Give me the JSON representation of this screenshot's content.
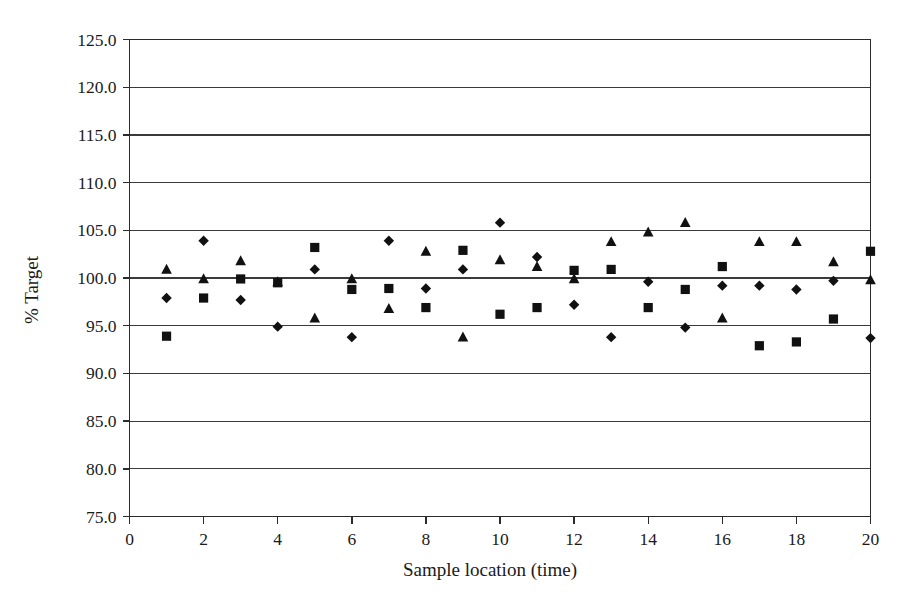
{
  "chart_data": {
    "type": "scatter",
    "title": "",
    "xlabel": "Sample location (time)",
    "ylabel": "% Target",
    "xlim": [
      0,
      20
    ],
    "ylim": [
      75.0,
      125.0
    ],
    "xticks": [
      0,
      2,
      4,
      6,
      8,
      10,
      12,
      14,
      16,
      18,
      20
    ],
    "xtick_labels": [
      "0",
      "2",
      "4",
      "6",
      "8",
      "10",
      "12",
      "14",
      "16",
      "18",
      "20"
    ],
    "yticks": [
      75.0,
      80.0,
      85.0,
      90.0,
      95.0,
      100.0,
      105.0,
      110.0,
      115.0,
      120.0,
      125.0
    ],
    "ytick_labels": [
      "75.0",
      "80.0",
      "85.0",
      "90.0",
      "95.0",
      "100.0",
      "105.0",
      "110.0",
      "115.0",
      "120.0",
      "125.0"
    ],
    "grid": "horizontal",
    "legend": "none",
    "marker_color": "#111111",
    "series": [
      {
        "name": "Series 1",
        "marker": "diamond",
        "x": [
          1,
          2,
          3,
          4,
          5,
          6,
          7,
          8,
          9,
          10,
          11,
          12,
          13,
          14,
          15,
          16,
          17,
          18,
          19,
          20
        ],
        "values": [
          97.9,
          103.9,
          97.7,
          94.9,
          100.9,
          93.8,
          103.9,
          98.9,
          100.9,
          105.8,
          102.2,
          97.2,
          93.8,
          99.6,
          94.8,
          99.2,
          99.2,
          98.8,
          99.7,
          93.7
        ]
      },
      {
        "name": "Series 2",
        "marker": "square",
        "x": [
          1,
          2,
          3,
          4,
          5,
          6,
          7,
          8,
          9,
          10,
          11,
          12,
          13,
          14,
          15,
          16,
          17,
          18,
          19,
          20
        ],
        "values": [
          93.9,
          97.9,
          99.9,
          99.5,
          103.2,
          98.8,
          98.9,
          96.9,
          102.9,
          96.2,
          96.9,
          100.8,
          100.9,
          96.9,
          98.8,
          101.2,
          92.9,
          93.3,
          95.7,
          102.8
        ]
      },
      {
        "name": "Series 3",
        "marker": "triangle",
        "x": [
          1,
          2,
          3,
          4,
          5,
          6,
          7,
          8,
          9,
          10,
          11,
          12,
          13,
          14,
          15,
          16,
          17,
          18,
          19,
          20
        ],
        "values": [
          100.9,
          99.9,
          101.8,
          99.6,
          95.8,
          99.9,
          96.8,
          102.8,
          93.8,
          101.9,
          101.2,
          99.9,
          103.8,
          104.8,
          105.8,
          95.8,
          103.8,
          103.8,
          101.7,
          99.8
        ]
      }
    ]
  }
}
